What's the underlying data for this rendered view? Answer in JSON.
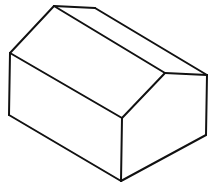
{
  "figure": {
    "background": "#ffffff",
    "stroke_color": "#111111",
    "stroke_width": 2,
    "vertices": {
      "ridge_back": [
        54,
        6
      ],
      "ridge_back_right": [
        95,
        8
      ],
      "eave_left_top": [
        10,
        53
      ],
      "eave_front_top": [
        122,
        118
      ],
      "gable_peak": [
        165,
        73
      ],
      "gable_right_top": [
        207,
        75
      ],
      "base_left": [
        9,
        115
      ],
      "base_front": [
        121,
        181
      ],
      "base_right": [
        206,
        135
      ]
    },
    "faces": [
      {
        "name": "roof-left-plane",
        "points": "54,6 165,73 122,118 10,53"
      },
      {
        "name": "roof-back-plane",
        "points": "54,6 95,8 207,75 165,73"
      },
      {
        "name": "front-wall",
        "points": "10,53 122,118 121,181 9,115"
      },
      {
        "name": "gable-end-wall",
        "points": "122,118 165,73 207,75 206,135 121,181"
      }
    ],
    "edges": [
      {
        "name": "ridge-line",
        "d": "M54,6 L165,73"
      },
      {
        "name": "back-ridge-cap",
        "d": "M54,6 L95,8"
      },
      {
        "name": "back-roof-edge",
        "d": "M95,8 L207,75"
      },
      {
        "name": "left-roof-slope",
        "d": "M54,6 L10,53"
      },
      {
        "name": "front-eave",
        "d": "M10,53 L122,118"
      },
      {
        "name": "gable-left-slope",
        "d": "M122,118 L165,73"
      },
      {
        "name": "gable-top-edge",
        "d": "M165,73 L207,75"
      },
      {
        "name": "left-wall-vertical",
        "d": "M10,53 L9,115"
      },
      {
        "name": "front-corner-vertical",
        "d": "M122,118 L121,181"
      },
      {
        "name": "right-wall-vertical",
        "d": "M207,75 L206,135"
      },
      {
        "name": "base-left-edge",
        "d": "M9,115 L121,181"
      },
      {
        "name": "base-right-edge",
        "d": "M121,181 L206,135"
      }
    ]
  }
}
